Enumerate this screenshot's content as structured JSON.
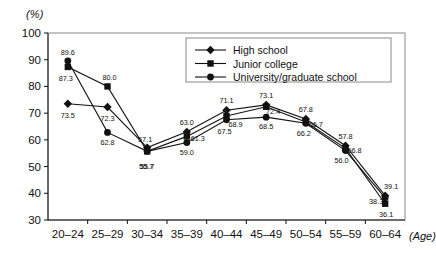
{
  "axis": {
    "y_unit": "(%)",
    "x_unit": "(Age)",
    "yticks": [
      "100",
      "90",
      "80",
      "70",
      "60",
      "50",
      "40",
      "30"
    ],
    "xticks": [
      "20–24",
      "25–29",
      "30–34",
      "35–39",
      "40–44",
      "45–49",
      "50–54",
      "55–59",
      "60–64"
    ]
  },
  "legend": {
    "items": [
      {
        "label": "High school",
        "marker": "diamond"
      },
      {
        "label": "Junior college",
        "marker": "square"
      },
      {
        "label": "University/graduate school",
        "marker": "circle"
      }
    ]
  },
  "chart_data": {
    "type": "line",
    "title": "",
    "xlabel": "(Age)",
    "ylabel": "(%)",
    "ylim": [
      30,
      100
    ],
    "ytick_step": 10,
    "grid": false,
    "legend_position": "top-right",
    "categories": [
      "20–24",
      "25–29",
      "30–34",
      "35–39",
      "40–44",
      "45–49",
      "50–54",
      "55–59",
      "60–64"
    ],
    "series": [
      {
        "name": "High school",
        "marker": "diamond",
        "values": [
          73.5,
          72.3,
          57.1,
          63.0,
          71.1,
          73.1,
          67.8,
          57.8,
          39.1
        ],
        "labels": [
          "73.5",
          "72.3",
          "57.1",
          "63.0",
          "71.1",
          "73.1",
          "67.8",
          "57.8",
          "39.1"
        ]
      },
      {
        "name": "Junior college",
        "marker": "square",
        "values": [
          87.3,
          80.0,
          55.7,
          61.3,
          68.9,
          72.4,
          66.7,
          56.8,
          36.1
        ],
        "labels": [
          "87.3",
          "80.0",
          "55.7",
          "61.3",
          "68.9",
          "72.4",
          "66.7",
          "56.8",
          "36.1"
        ]
      },
      {
        "name": "University/graduate school",
        "marker": "circle",
        "values": [
          89.6,
          62.8,
          55.7,
          59.0,
          67.5,
          68.5,
          66.2,
          56.0,
          38.3
        ],
        "labels": [
          "89.6",
          "62.8",
          "55.7",
          "59.0",
          "67.5",
          "68.5",
          "66.2",
          "56.0",
          "38.3"
        ]
      }
    ]
  }
}
